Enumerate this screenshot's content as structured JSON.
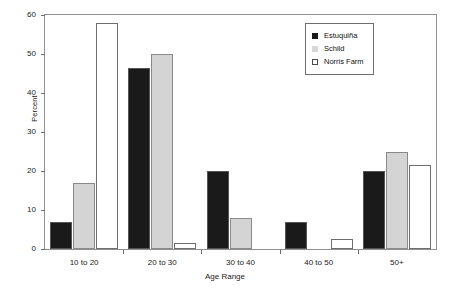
{
  "chart_data": {
    "type": "bar",
    "title": "",
    "xlabel": "Age Range",
    "ylabel": "Percent",
    "categories": [
      "10 to 20",
      "20 to 30",
      "30 to 40",
      "40 to 50",
      "50+"
    ],
    "series": [
      {
        "name": "Estuquiña",
        "values": [
          7,
          46.5,
          20,
          7,
          20
        ],
        "color": "#1a1a1a"
      },
      {
        "name": "Schild",
        "values": [
          17,
          50,
          8,
          0,
          25
        ],
        "color": "#d4d4d4"
      },
      {
        "name": "Norris Farm",
        "values": [
          58,
          1.5,
          0,
          2.5,
          21.5
        ],
        "color": "#ffffff"
      }
    ],
    "ylim": [
      0,
      60
    ],
    "yticks": [
      0,
      10,
      20,
      30,
      40,
      50,
      60
    ],
    "grid": false,
    "legend_position": "upper right"
  },
  "legend": {
    "entries": [
      "Estuquiña",
      "Schild",
      "Norris Farm"
    ]
  }
}
